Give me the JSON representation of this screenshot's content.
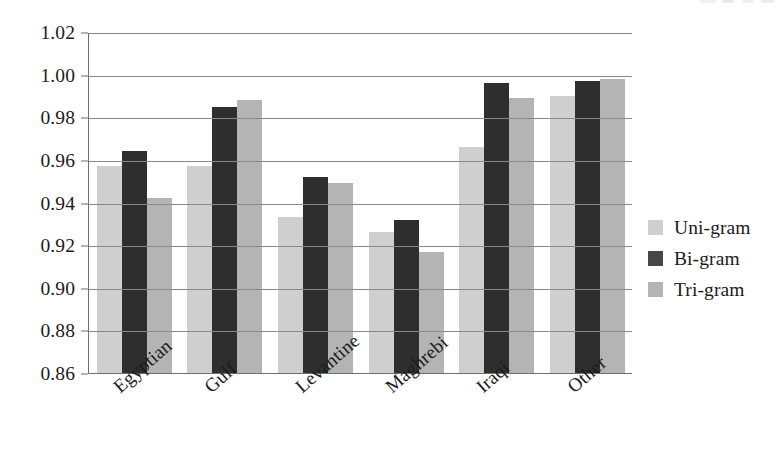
{
  "chart_data": {
    "type": "bar",
    "title": "",
    "subtitle": "",
    "xlabel": "",
    "ylabel": "",
    "categories": [
      "Egyptian",
      "Gulf",
      "Levantine",
      "Maghrebi",
      "Iraqi",
      "Other"
    ],
    "series": [
      {
        "name": "Uni-gram",
        "color": "#cfcfcf",
        "values": [
          0.957,
          0.957,
          0.933,
          0.926,
          0.966,
          0.99
        ]
      },
      {
        "name": "Bi-gram",
        "color": "#2e2e2e",
        "values": [
          0.964,
          0.985,
          0.952,
          0.932,
          0.996,
          0.997
        ]
      },
      {
        "name": "Tri-gram",
        "color": "#b4b4b4",
        "values": [
          0.942,
          0.988,
          0.949,
          0.917,
          0.989,
          0.998
        ]
      }
    ],
    "ylim": [
      0.86,
      1.02
    ],
    "yticks": [
      0.86,
      0.88,
      0.9,
      0.92,
      0.94,
      0.96,
      0.98,
      1.0,
      1.02
    ],
    "ytick_labels": [
      "0.86",
      "0.88",
      "0.90",
      "0.92",
      "0.94",
      "0.96",
      "0.98",
      "1.00",
      "1.02"
    ],
    "grid": true,
    "grid_axis": "y",
    "legend_position": "right",
    "xtick_rotation": -41
  },
  "legend": {
    "entries": [
      {
        "label": "Uni-gram"
      },
      {
        "label": "Bi-gram"
      },
      {
        "label": "Tri-gram"
      }
    ]
  }
}
